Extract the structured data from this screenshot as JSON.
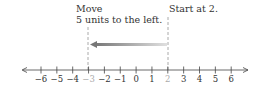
{
  "annotations": {
    "move_line1": "Move",
    "move_line2": "5 units to the left.",
    "start": "Start at 2."
  },
  "number_line": {
    "min": -6,
    "max": 6,
    "ticks": [
      "−6",
      "−5",
      "−4",
      "−3",
      "−2",
      "−1",
      "0",
      "1",
      "2",
      "3",
      "4",
      "5",
      "6"
    ],
    "highlighted": [
      "−3",
      "2"
    ],
    "start_value": 2,
    "end_value": -3,
    "move": -5
  },
  "colors": {
    "axis": "#333333",
    "highlight_tick_label": "#aaaaaa",
    "arrow": "#777777",
    "dashed": "#999999"
  }
}
